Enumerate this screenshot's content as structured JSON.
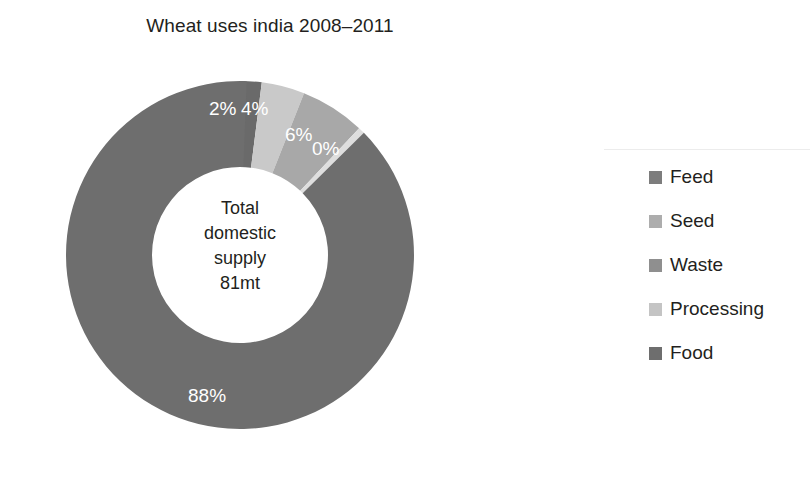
{
  "chart_data": {
    "type": "pie",
    "variant": "donut",
    "title": "Wheat uses india 2008–2011",
    "xlabel": "",
    "ylabel": "",
    "legend_position": "right",
    "grid": false,
    "center_label": {
      "lines": [
        "Total",
        "domestic",
        "supply",
        "81mt"
      ],
      "text": "Total domestic supply 81mt",
      "total_value": 81,
      "units": "mt"
    },
    "start_angle_deg": 0,
    "direction": "clockwise",
    "categories": [
      "Feed",
      "Seed",
      "Waste",
      "Processing",
      "Food"
    ],
    "values": [
      2,
      4,
      6,
      0,
      88
    ],
    "value_labels": [
      "2%",
      "4%",
      "6%",
      "0%",
      "88%"
    ],
    "units": "percent",
    "colors": [
      "#6a6a6a",
      "#c9c9c9",
      "#a8a8a8",
      "#dedede",
      "#6e6e6e"
    ],
    "slices": [
      {
        "label": "Feed",
        "value": 2,
        "display": "2%",
        "color": "#6a6a6a"
      },
      {
        "label": "Seed",
        "value": 4,
        "display": "4%",
        "color": "#c9c9c9"
      },
      {
        "label": "Waste",
        "value": 6,
        "display": "6%",
        "color": "#a8a8a8"
      },
      {
        "label": "Processing",
        "value": 0,
        "display": "0%",
        "color": "#dedede"
      },
      {
        "label": "Food",
        "value": 88,
        "display": "88%",
        "color": "#6e6e6e"
      }
    ]
  },
  "legend": {
    "items": [
      {
        "label": "Feed",
        "color": "#7d7d7d"
      },
      {
        "label": "Seed",
        "color": "#adadad"
      },
      {
        "label": "Waste",
        "color": "#8f8f8f"
      },
      {
        "label": "Processing",
        "color": "#c4c4c4"
      },
      {
        "label": "Food",
        "color": "#6e6e6e"
      }
    ]
  },
  "colors": {
    "background": "#ffffff",
    "text": "#231f20",
    "label_text": "#ffffff"
  }
}
